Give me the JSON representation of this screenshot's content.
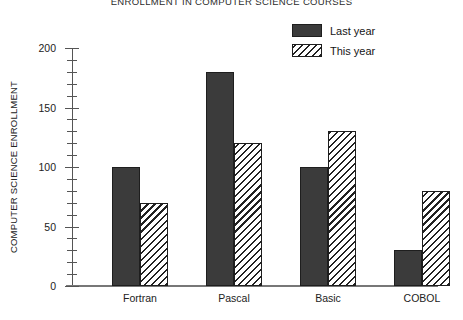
{
  "chart_data": {
    "type": "bar",
    "title": "ENROLLMENT IN COMPUTER SCIENCE COURSES",
    "xlabel": "",
    "ylabel": "COMPUTER SCIENCE ENROLLMENT",
    "categories": [
      "Fortran",
      "Pascal",
      "Basic",
      "COBOL"
    ],
    "series": [
      {
        "name": "Last year",
        "values": [
          100,
          180,
          100,
          30
        ],
        "fill": "solid",
        "color": "#3b3b3b"
      },
      {
        "name": "This year",
        "values": [
          70,
          120,
          130,
          80
        ],
        "fill": "hatch",
        "color": "#ffffff"
      }
    ],
    "ylim": [
      0,
      200
    ],
    "y_major_ticks": [
      0,
      50,
      100,
      150,
      200
    ],
    "y_major_tick_labels": [
      "0",
      "50",
      "100",
      "150",
      "200"
    ],
    "y_minor_tick_interval": 10,
    "grid": false,
    "legend_position": "top-right"
  },
  "legend": {
    "entries": [
      {
        "label": "Last year"
      },
      {
        "label": "This year"
      }
    ]
  }
}
